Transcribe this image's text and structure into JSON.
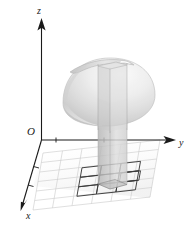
{
  "figure": {
    "background_color": "#ffffff",
    "axes": {
      "origin_label": "O",
      "x_label": "x",
      "y_label": "y",
      "z_label": "z",
      "axis_color": "#1a1a1a",
      "tick_count_y": 2,
      "tick_count_x": 2
    },
    "surface": {
      "name": "dome-surface",
      "shape": "hemisphere-dome",
      "fill_light": "#f2f2f2",
      "fill_mid": "#d8d8d8",
      "fill_dark": "#b8b8b8",
      "edge_color": "#9a9a9a"
    },
    "column": {
      "name": "riemann-column",
      "shape": "rectangular-prism",
      "front_fill": "#d4d4d4",
      "side_fill": "#bfbfbf",
      "edge_color": "#a8a8a8"
    },
    "grid": {
      "name": "base-grid",
      "rows": 6,
      "cols": 6,
      "line_color": "#c9c9c9",
      "highlight_line_color": "#3a3a3a",
      "highlight_cells": [
        {
          "row": 2,
          "col": 4
        },
        {
          "row": 3,
          "col": 2
        },
        {
          "row": 3,
          "col": 3
        },
        {
          "row": 3,
          "col": 4
        },
        {
          "row": 4,
          "col": 2
        },
        {
          "row": 4,
          "col": 3
        },
        {
          "row": 4,
          "col": 4
        }
      ]
    }
  }
}
